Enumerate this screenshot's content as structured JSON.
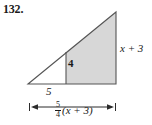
{
  "figure": {
    "problem_number": "132.",
    "shape": "right-triangle-with-shaded-subregion",
    "fill_color": "#d7d7d7",
    "stroke_color": "#4d4d4d",
    "text_color": "#1a1a1a",
    "labels": {
      "right_side": "x + 3",
      "inner_height": "4",
      "base_segment": "5",
      "total_base_numerator": "5",
      "total_base_denominator": "4",
      "total_base_expression": "(x + 3)",
      "total_base_full": "5/4(x + 3)"
    },
    "geometry": {
      "apex_left": [
        28,
        84
      ],
      "apex_top_right": [
        116,
        12
      ],
      "base_right": [
        116,
        84
      ],
      "divider_x": 66,
      "divider_top_y": 52,
      "divider_bottom_y": 84,
      "dimension_line_y": 107,
      "dimension_line_x_start": 28,
      "dimension_line_x_end": 117
    }
  }
}
